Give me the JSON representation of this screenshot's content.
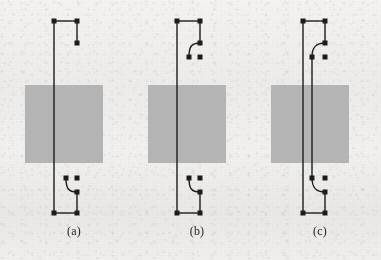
{
  "figure": {
    "width": 381,
    "height": 260,
    "background_color": "#f2f1ef",
    "ink_color": "#1c1c1c",
    "block_color": "#b4b4b4",
    "panels": [
      {
        "id": "a",
        "label": "(a)",
        "label_x": 74,
        "label_y": 231,
        "block": {
          "x": 25,
          "y": 85,
          "width": 78,
          "height": 78
        },
        "description": "single straight conductor with open stub at top and curved stub at bottom",
        "lines": [
          {
            "name": "main-vertical-trace",
            "points": "54,21 54,213"
          },
          {
            "name": "top-horizontal-trace",
            "points": "54,21 77,21"
          },
          {
            "name": "top-right-vertical-stub",
            "points": "77,21 77,43"
          },
          {
            "name": "bottom-right-vertical-stub",
            "points": "77,192 77,213"
          },
          {
            "name": "bottom-horizontal-trace",
            "points": "54,213 77,213"
          }
        ],
        "curves": [
          {
            "name": "bottom-bend-curve",
            "path": "M 66,178 C 66,188 68,192 77,192"
          }
        ],
        "nodes": [
          {
            "name": "node-top-left",
            "x": 54,
            "y": 21
          },
          {
            "name": "node-top-right",
            "x": 77,
            "y": 21
          },
          {
            "name": "node-top-stub-end",
            "x": 77,
            "y": 43
          },
          {
            "name": "node-bottom-curve-start",
            "x": 66,
            "y": 178
          },
          {
            "name": "node-bottom-free",
            "x": 77,
            "y": 178
          },
          {
            "name": "node-bottom-curve-end",
            "x": 77,
            "y": 192
          },
          {
            "name": "node-bottom-left",
            "x": 54,
            "y": 213
          },
          {
            "name": "node-bottom-right",
            "x": 77,
            "y": 213
          }
        ]
      },
      {
        "id": "b",
        "label": "(b)",
        "label_x": 197,
        "label_y": 231,
        "block": {
          "x": 148,
          "y": 85,
          "width": 78,
          "height": 78
        },
        "description": "single straight conductor with curved stubs at both top and bottom",
        "lines": [
          {
            "name": "main-vertical-trace",
            "points": "177,21 177,213"
          },
          {
            "name": "top-horizontal-trace",
            "points": "177,21 200,21"
          },
          {
            "name": "top-right-vertical-stub",
            "points": "200,21 200,43"
          },
          {
            "name": "bottom-right-vertical-stub",
            "points": "200,192 200,213"
          },
          {
            "name": "bottom-horizontal-trace",
            "points": "177,213 200,213"
          }
        ],
        "curves": [
          {
            "name": "top-bend-curve",
            "path": "M 200,43 C 191,43 189,47 189,57"
          },
          {
            "name": "bottom-bend-curve",
            "path": "M 189,178 C 189,188 191,192 200,192"
          }
        ],
        "nodes": [
          {
            "name": "node-top-left",
            "x": 177,
            "y": 21
          },
          {
            "name": "node-top-right",
            "x": 200,
            "y": 21
          },
          {
            "name": "node-top-curve-start",
            "x": 200,
            "y": 43
          },
          {
            "name": "node-top-curve-end",
            "x": 189,
            "y": 57
          },
          {
            "name": "node-top-free",
            "x": 200,
            "y": 57
          },
          {
            "name": "node-bottom-curve-start",
            "x": 189,
            "y": 178
          },
          {
            "name": "node-bottom-free",
            "x": 200,
            "y": 178
          },
          {
            "name": "node-bottom-curve-end",
            "x": 200,
            "y": 192
          },
          {
            "name": "node-bottom-left",
            "x": 177,
            "y": 213
          },
          {
            "name": "node-bottom-right",
            "x": 200,
            "y": 213
          }
        ]
      },
      {
        "id": "c",
        "label": "(c)",
        "label_x": 320,
        "label_y": 231,
        "block": {
          "x": 271,
          "y": 85,
          "width": 78,
          "height": 78
        },
        "description": "two parallel conductors with curved stubs joining at top and bottom",
        "lines": [
          {
            "name": "main-vertical-trace",
            "points": "303,21 303,213"
          },
          {
            "name": "second-vertical-trace",
            "points": "312,57 312,178"
          },
          {
            "name": "top-horizontal-trace",
            "points": "303,21 325,21"
          },
          {
            "name": "top-right-vertical-stub",
            "points": "325,21 325,43"
          },
          {
            "name": "bottom-right-vertical-stub",
            "points": "325,192 325,213"
          },
          {
            "name": "bottom-horizontal-trace",
            "points": "303,213 325,213"
          }
        ],
        "curves": [
          {
            "name": "top-bend-curve",
            "path": "M 325,43 C 316,43 312,47 312,57"
          },
          {
            "name": "bottom-bend-curve",
            "path": "M 312,178 C 312,188 316,192 325,192"
          }
        ],
        "nodes": [
          {
            "name": "node-top-left",
            "x": 303,
            "y": 21
          },
          {
            "name": "node-top-right",
            "x": 325,
            "y": 21
          },
          {
            "name": "node-top-curve-start",
            "x": 325,
            "y": 43
          },
          {
            "name": "node-top-curve-end",
            "x": 312,
            "y": 57
          },
          {
            "name": "node-top-free",
            "x": 325,
            "y": 57
          },
          {
            "name": "node-bottom-curve-start",
            "x": 312,
            "y": 178
          },
          {
            "name": "node-bottom-free",
            "x": 325,
            "y": 178
          },
          {
            "name": "node-bottom-curve-end",
            "x": 325,
            "y": 192
          },
          {
            "name": "node-bottom-left",
            "x": 303,
            "y": 213
          },
          {
            "name": "node-bottom-right",
            "x": 325,
            "y": 213
          }
        ]
      }
    ]
  }
}
